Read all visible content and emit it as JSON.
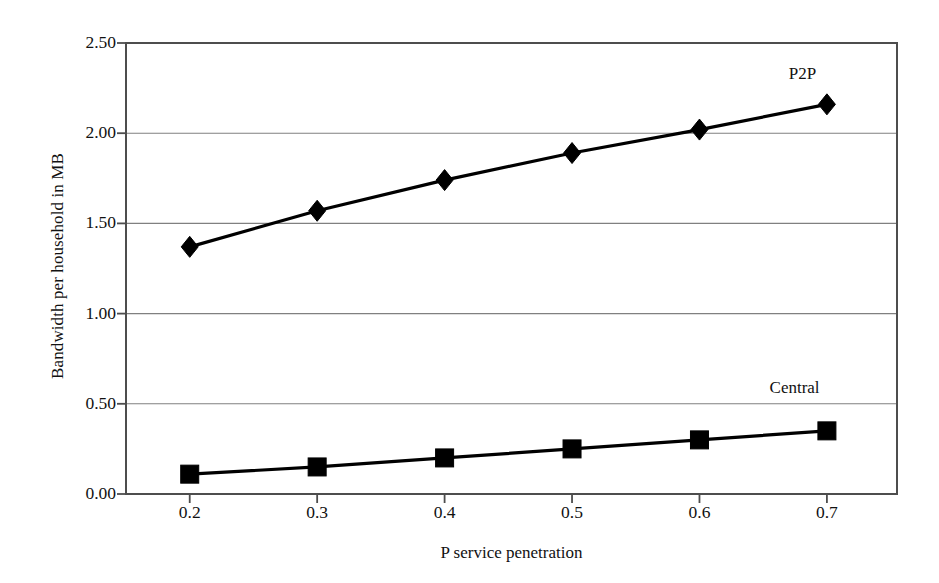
{
  "chart_data": {
    "type": "line",
    "title": "",
    "xlabel": "P service penetration",
    "ylabel": "Bandwidth per household in MB",
    "x": [
      0.2,
      0.3,
      0.4,
      0.5,
      0.6,
      0.7
    ],
    "xtick_labels": [
      "0.2",
      "0.3",
      "0.4",
      "0.5",
      "0.6",
      "0.7"
    ],
    "ytick_labels": [
      "0.00",
      "0.50",
      "1.00",
      "1.50",
      "2.00",
      "2.50"
    ],
    "ytick_values": [
      0.0,
      0.5,
      1.0,
      1.5,
      2.0,
      2.5
    ],
    "ylim": [
      0.0,
      2.5
    ],
    "xlim": [
      0.15,
      0.755
    ],
    "grid": "horizontal",
    "legend_position": "inline-annotation",
    "series": [
      {
        "name": "P2P",
        "marker": "diamond",
        "color": "#000000",
        "values": [
          1.37,
          1.57,
          1.74,
          1.89,
          2.02,
          2.16
        ],
        "annotation": {
          "text": "P2P",
          "x": 0.67,
          "y": 2.33
        }
      },
      {
        "name": "Central",
        "marker": "square",
        "color": "#000000",
        "values": [
          0.11,
          0.15,
          0.2,
          0.25,
          0.3,
          0.35
        ],
        "annotation": {
          "text": "Central",
          "x": 0.655,
          "y": 0.585
        }
      }
    ]
  },
  "axes": {
    "y_title": "Bandwidth per household in MB",
    "x_title": "P service penetration"
  },
  "style": {
    "axis_color": "#4d4d4d",
    "grid_color": "#808080",
    "series_color": "#000000",
    "background": "#ffffff"
  }
}
